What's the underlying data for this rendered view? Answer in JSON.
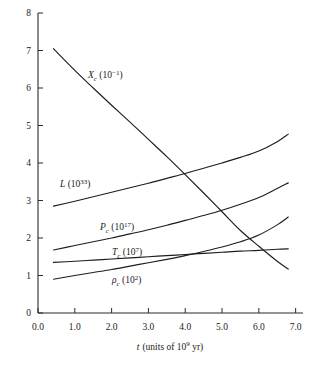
{
  "chart_data": {
    "type": "line",
    "title": "",
    "xlabel": "t (units of 10^9 yr)",
    "ylabel": "",
    "xlim": [
      0.0,
      7.2
    ],
    "ylim": [
      0,
      8
    ],
    "grid": false,
    "legend": "inline-curve-labels",
    "xticks": [
      "0.0",
      "1.0",
      "2.0",
      "3.0",
      "4.0",
      "5.0",
      "6.0",
      "7.0"
    ],
    "xtick_values": [
      0,
      1,
      2,
      3,
      4,
      5,
      6,
      7
    ],
    "yticks": [
      "0",
      "1",
      "2",
      "3",
      "4",
      "5",
      "6",
      "7",
      "8"
    ],
    "ytick_values": [
      0,
      1,
      2,
      3,
      4,
      5,
      6,
      7,
      8
    ],
    "x": [
      0.42,
      1.0,
      1.5,
      2.0,
      2.5,
      3.0,
      3.5,
      4.0,
      4.5,
      5.0,
      5.5,
      6.0,
      6.5,
      6.8
    ],
    "series": [
      {
        "name": "X_c",
        "label": "X_c (10^-1)",
        "values": [
          7.05,
          6.47,
          6.0,
          5.54,
          5.09,
          4.63,
          4.17,
          3.69,
          3.2,
          2.7,
          2.2,
          1.78,
          1.38,
          1.17
        ]
      },
      {
        "name": "L",
        "label": "L (10^33)",
        "values": [
          2.85,
          2.98,
          3.1,
          3.22,
          3.34,
          3.46,
          3.59,
          3.72,
          3.86,
          4.0,
          4.15,
          4.32,
          4.57,
          4.77
        ]
      },
      {
        "name": "P_c",
        "label": "P_c (10^17)",
        "values": [
          1.68,
          1.8,
          1.9,
          2.0,
          2.11,
          2.22,
          2.34,
          2.47,
          2.6,
          2.74,
          2.9,
          3.08,
          3.32,
          3.47
        ]
      },
      {
        "name": "rho_c",
        "label": "rho_c (10^2)",
        "values": [
          0.9,
          1.0,
          1.08,
          1.16,
          1.25,
          1.34,
          1.43,
          1.53,
          1.64,
          1.76,
          1.9,
          2.08,
          2.35,
          2.56
        ]
      },
      {
        "name": "T_c",
        "label": "T_c (10^7)",
        "values": [
          1.35,
          1.38,
          1.41,
          1.44,
          1.47,
          1.5,
          1.53,
          1.56,
          1.59,
          1.62,
          1.65,
          1.67,
          1.7,
          1.71
        ]
      }
    ]
  },
  "labels": {
    "x_axis": {
      "sym": "t",
      "rest": "(units of 10",
      "exp": "9",
      "tail": " yr)"
    },
    "curves": {
      "xc": {
        "sym": "X",
        "sub": "c",
        "open": " (10",
        "exp": "−1",
        "close": ")"
      },
      "l": {
        "sym": "L",
        "sub": "",
        "open": " (10",
        "exp": "33",
        "close": ")"
      },
      "pc": {
        "sym": "P",
        "sub": "c",
        "open": " (10",
        "exp": "17",
        "close": ")"
      },
      "tc": {
        "sym": "T",
        "sub": "c",
        "open": " (10",
        "exp": "7",
        "close": ")"
      },
      "rhoc": {
        "sym": "ρ",
        "sub": "c",
        "open": " (10",
        "exp": "2",
        "close": ")"
      }
    }
  },
  "ticks": {
    "x": [
      "0.0",
      "1.0",
      "2.0",
      "3.0",
      "4.0",
      "5.0",
      "6.0",
      "7.0"
    ],
    "y": [
      "0",
      "1",
      "2",
      "3",
      "4",
      "5",
      "6",
      "7",
      "8"
    ]
  },
  "colors": {
    "ink": "#1d1d1d",
    "axis": "#2b2b2b",
    "background": "#ffffff"
  }
}
